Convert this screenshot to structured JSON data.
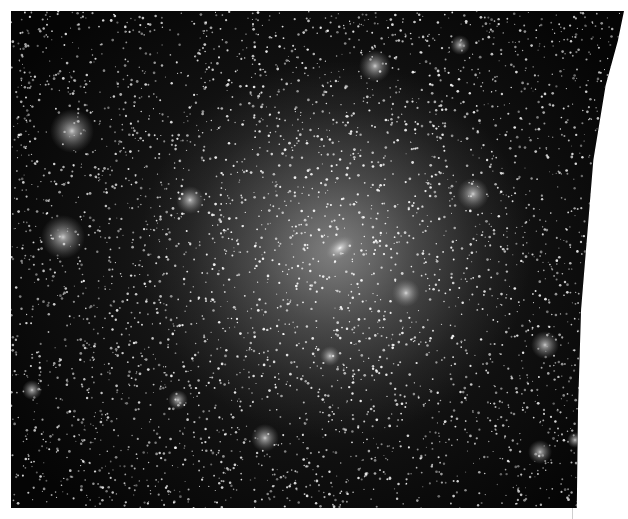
{
  "image": {
    "subject": "dark-matter halo simulation render",
    "colormap": "grayscale",
    "main_halo": {
      "x": 340,
      "y": 248
    },
    "subhalos": [
      {
        "x": 72,
        "y": 131,
        "r": 22
      },
      {
        "x": 63,
        "y": 237,
        "r": 22
      },
      {
        "x": 190,
        "y": 200,
        "r": 14
      },
      {
        "x": 375,
        "y": 66,
        "r": 16
      },
      {
        "x": 473,
        "y": 194,
        "r": 16
      },
      {
        "x": 406,
        "y": 293,
        "r": 14
      },
      {
        "x": 545,
        "y": 345,
        "r": 14
      },
      {
        "x": 265,
        "y": 438,
        "r": 14
      },
      {
        "x": 330,
        "y": 356,
        "r": 10
      },
      {
        "x": 32,
        "y": 390,
        "r": 10
      },
      {
        "x": 178,
        "y": 400,
        "r": 10
      },
      {
        "x": 540,
        "y": 452,
        "r": 12
      },
      {
        "x": 460,
        "y": 45,
        "r": 10
      },
      {
        "x": 575,
        "y": 440,
        "r": 8
      }
    ]
  }
}
